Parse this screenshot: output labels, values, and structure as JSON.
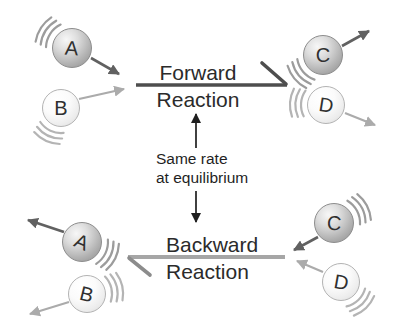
{
  "diagram": {
    "forward": {
      "line1": "Forward",
      "line2": "Reaction"
    },
    "backward": {
      "line1": "Backward",
      "line2": "Reaction"
    },
    "equilibrium_note": {
      "line1": "Same rate",
      "line2": "at equilibrium"
    },
    "molecules": {
      "top_left_a": "A",
      "top_left_b": "B",
      "top_right_c": "C",
      "top_right_d": "D",
      "bottom_left_a": "A",
      "bottom_left_b": "B",
      "bottom_right_c": "C",
      "bottom_right_d": "D"
    },
    "colors": {
      "dark_arrow": "#616161",
      "light_arrow": "#ababab",
      "forward_line": "#4e4e4e",
      "backward_line": "#a6a6a6",
      "connector_arrow": "#1f1f1f",
      "text": "#2b2b2b",
      "background": "#ffffff"
    }
  }
}
